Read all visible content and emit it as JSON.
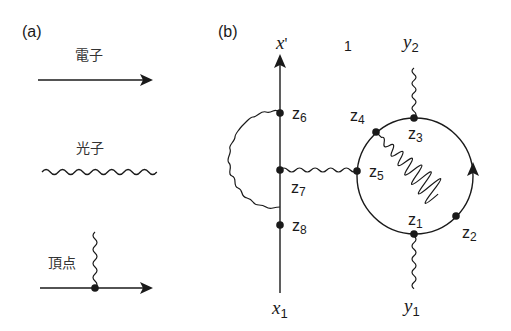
{
  "panel_a": {
    "label": "(a)",
    "legend": [
      {
        "name": "電子",
        "meaning": "electron",
        "line": "straight arrow"
      },
      {
        "name": "光子",
        "meaning": "photon",
        "line": "wavy"
      },
      {
        "name": "頂点",
        "meaning": "vertex",
        "line": "wavy meets straight arrow at dot"
      }
    ]
  },
  "panel_b": {
    "label": "(b)",
    "number_label": "1",
    "external_points": {
      "x_prime": {
        "base": "x",
        "mark": "'"
      },
      "x1": {
        "base": "x",
        "sub": "1"
      },
      "y1": {
        "base": "y",
        "sub": "1"
      },
      "y2": {
        "base": "y",
        "sub": "2"
      }
    },
    "vertices": [
      {
        "base": "z",
        "sub": "1"
      },
      {
        "base": "z",
        "sub": "2"
      },
      {
        "base": "z",
        "sub": "3"
      },
      {
        "base": "z",
        "sub": "4"
      },
      {
        "base": "z",
        "sub": "5"
      },
      {
        "base": "z",
        "sub": "6"
      },
      {
        "base": "z",
        "sub": "7"
      },
      {
        "base": "z",
        "sub": "8"
      }
    ]
  },
  "colors": {
    "line": "#1a1a1a",
    "background": "#ffffff"
  }
}
